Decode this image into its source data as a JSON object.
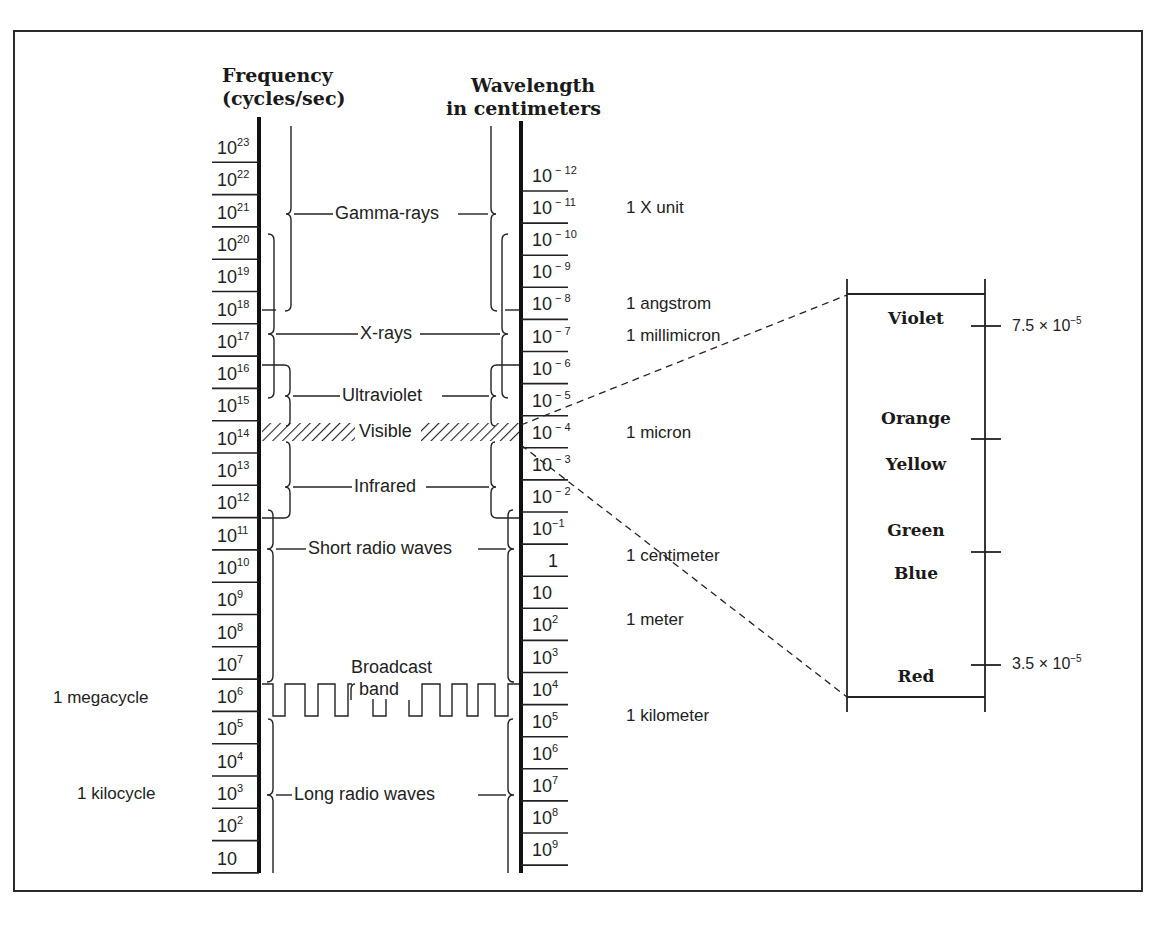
{
  "headers": {
    "frequency_line1": "Frequency",
    "frequency_line2": "(cycles/sec)",
    "wavelength_line1": "Wavelength",
    "wavelength_line2": "in centimeters"
  },
  "frequency_ticks": [
    {
      "base": "10",
      "exp": "23"
    },
    {
      "base": "10",
      "exp": "22"
    },
    {
      "base": "10",
      "exp": "21"
    },
    {
      "base": "10",
      "exp": "20"
    },
    {
      "base": "10",
      "exp": "19"
    },
    {
      "base": "10",
      "exp": "18"
    },
    {
      "base": "10",
      "exp": "17"
    },
    {
      "base": "10",
      "exp": "16"
    },
    {
      "base": "10",
      "exp": "15"
    },
    {
      "base": "10",
      "exp": "14"
    },
    {
      "base": "10",
      "exp": "13"
    },
    {
      "base": "10",
      "exp": "12"
    },
    {
      "base": "10",
      "exp": "11"
    },
    {
      "base": "10",
      "exp": "10"
    },
    {
      "base": "10",
      "exp": "9"
    },
    {
      "base": "10",
      "exp": "8"
    },
    {
      "base": "10",
      "exp": "7"
    },
    {
      "base": "10",
      "exp": "6"
    },
    {
      "base": "10",
      "exp": "5"
    },
    {
      "base": "10",
      "exp": "4"
    },
    {
      "base": "10",
      "exp": "3"
    },
    {
      "base": "10",
      "exp": "2"
    },
    {
      "base": "10",
      "exp": ""
    }
  ],
  "wavelength_ticks": [
    {
      "base": "10",
      "exp": " − 12"
    },
    {
      "base": "10",
      "exp": " − 11"
    },
    {
      "base": "10",
      "exp": " − 10"
    },
    {
      "base": "10",
      "exp": " − 9"
    },
    {
      "base": "10",
      "exp": " − 8"
    },
    {
      "base": "10",
      "exp": " − 7"
    },
    {
      "base": "10",
      "exp": " − 6"
    },
    {
      "base": "10",
      "exp": " − 5"
    },
    {
      "base": "10",
      "exp": " − 4"
    },
    {
      "base": "10",
      "exp": " − 3"
    },
    {
      "base": "10",
      "exp": " − 2"
    },
    {
      "base": "10",
      "exp": "−1"
    },
    {
      "base": "1",
      "exp": ""
    },
    {
      "base": "10",
      "exp": ""
    },
    {
      "base": "10",
      "exp": "2"
    },
    {
      "base": "10",
      "exp": "3"
    },
    {
      "base": "10",
      "exp": "4"
    },
    {
      "base": "10",
      "exp": "5"
    },
    {
      "base": "10",
      "exp": "6"
    },
    {
      "base": "10",
      "exp": "7"
    },
    {
      "base": "10",
      "exp": "8"
    },
    {
      "base": "10",
      "exp": "9"
    }
  ],
  "bands": {
    "gamma": "Gamma-rays",
    "xray": "X-rays",
    "uv": "Ultraviolet",
    "visible": "Visible",
    "infrared": "Infrared",
    "short_radio": "Short radio waves",
    "broadcast_line1": "Broadcast",
    "broadcast_line2": "band",
    "long_radio": "Long radio waves"
  },
  "frequency_units": {
    "megacycle": "1 megacycle",
    "kilocycle": "1 kilocycle"
  },
  "wavelength_units": {
    "x_unit": "1 X unit",
    "angstrom": "1 angstrom",
    "millimicron": "1 millimicron",
    "micron": "1 micron",
    "centimeter": "1 centimeter",
    "meter": "1 meter",
    "kilometer": "1 kilometer"
  },
  "visible_detail": {
    "colors": [
      "Violet",
      "Orange",
      "Yellow",
      "Green",
      "Blue",
      "Red"
    ],
    "upper_value": {
      "text": "7.5 × 10",
      "exp": "−5"
    },
    "lower_value": {
      "text": "3.5 × 10",
      "exp": "−5"
    }
  }
}
